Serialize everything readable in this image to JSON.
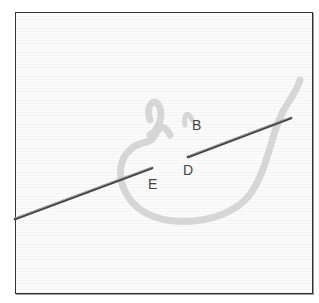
{
  "figure": {
    "labels": {
      "b": "B",
      "d": "D",
      "e": "E"
    },
    "colors": {
      "fabric": "#f8f8f8",
      "frame": "#333333",
      "yarn": "#dcdcdc",
      "needle": "#555555"
    }
  }
}
